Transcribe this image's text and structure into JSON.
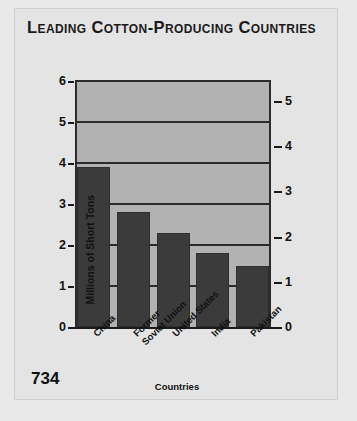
{
  "page": {
    "number": "734",
    "background_color": "#e9e9e9",
    "card_color": "#e4e4e4"
  },
  "chart_data": {
    "type": "bar",
    "title": "Leading Cotton-Producing Countries",
    "categories": [
      "China",
      "Former\nSoviet Union",
      "United States",
      "India",
      "Pakistan"
    ],
    "category_lines": [
      [
        "China"
      ],
      [
        "Former",
        "Soviet Union"
      ],
      [
        "United States"
      ],
      [
        "India"
      ],
      [
        "Pakistan"
      ]
    ],
    "values": [
      3.9,
      2.8,
      2.3,
      1.8,
      1.5
    ],
    "xlabel": "Countries",
    "ylabel": "Millions of Short Tons",
    "ylabel_secondary": "Millions of Metric Tons",
    "ylim": [
      0,
      6
    ],
    "yticks": [
      0,
      1,
      2,
      3,
      4,
      5,
      6
    ],
    "ytick_labels": [
      "0",
      "1",
      "2",
      "3",
      "4",
      "5",
      "6"
    ],
    "ylim_secondary": [
      0,
      5
    ],
    "yticks_secondary": [
      0,
      1,
      2,
      3,
      4,
      5
    ],
    "ytick_labels_secondary": [
      "0",
      "1",
      "2",
      "3",
      "4",
      "5"
    ],
    "grid": true,
    "legend_position": "none",
    "bar_color": "#3b3b3b",
    "plot_background_color": "#b2b2b2",
    "axis_color": "#1a1a1a"
  }
}
